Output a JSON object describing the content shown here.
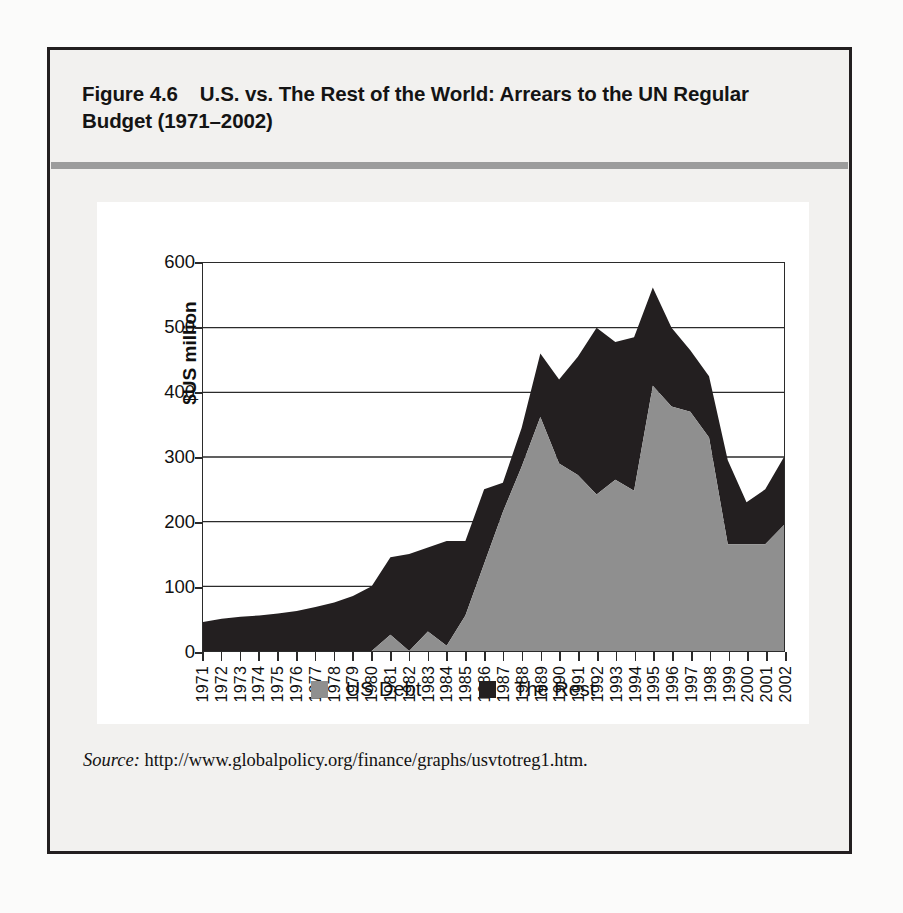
{
  "figure": {
    "number": "Figure 4.6",
    "title": "U.S. vs. The Rest of the World: Arrears to the UN Regular Budget (1971–2002)",
    "source_label": "Source:",
    "source_url": "http://www.globalpolicy.org/finance/graphs/usvtotreg1.htm."
  },
  "colors": {
    "us_debt": "#8f8f8f",
    "the_rest": "#231f20",
    "frame": "#231f20",
    "gridline": "#2b2b2b",
    "card_background": "#ffffff",
    "figure_background": "#f2f1ef",
    "title_rule": "#9c9c9c"
  },
  "chart_data": {
    "type": "area",
    "stacked": true,
    "title": "U.S. vs. The Rest of the World: Arrears to the UN Regular Budget (1971–2002)",
    "xlabel": "",
    "ylabel": "$US million",
    "ylim": [
      0,
      600
    ],
    "yticks": [
      0,
      100,
      200,
      300,
      400,
      500,
      600
    ],
    "ytick_labels": [
      "0",
      "100",
      "200",
      "300",
      "400",
      "500",
      "600"
    ],
    "grid": true,
    "grid_axis": "y",
    "legend_position": "bottom",
    "categories": [
      "1971",
      "1972",
      "1973",
      "1974",
      "1975",
      "1976",
      "1977",
      "1978",
      "1979",
      "1980",
      "1981",
      "1982",
      "1983",
      "1984",
      "1985",
      "1986",
      "1987",
      "1988",
      "1989",
      "1990",
      "1991",
      "1992",
      "1993",
      "1994",
      "1995",
      "1996",
      "1997",
      "1998",
      "1999",
      "2000",
      "2001",
      "2002"
    ],
    "series": [
      {
        "name": "US Debt",
        "color": "#8f8f8f",
        "values": [
          0,
          0,
          0,
          0,
          0,
          0,
          0,
          0,
          0,
          0,
          25,
          0,
          30,
          8,
          55,
          135,
          215,
          285,
          362,
          290,
          272,
          242,
          265,
          248,
          410,
          378,
          370,
          330,
          165,
          165,
          165,
          195
        ]
      },
      {
        "name": "The Rest",
        "color": "#231f20",
        "values": [
          45,
          50,
          53,
          55,
          58,
          62,
          68,
          75,
          85,
          100,
          120,
          150,
          130,
          162,
          115,
          115,
          45,
          60,
          98,
          130,
          183,
          258,
          213,
          237,
          152,
          122,
          95,
          95,
          130,
          65,
          85,
          105
        ]
      }
    ],
    "totals": [
      45,
      50,
      53,
      55,
      58,
      62,
      68,
      75,
      85,
      100,
      145,
      150,
      160,
      170,
      170,
      250,
      260,
      345,
      460,
      420,
      455,
      500,
      478,
      485,
      562,
      500,
      465,
      425,
      295,
      230,
      250,
      300
    ]
  },
  "legend": {
    "items": [
      {
        "label": "US Debt",
        "color": "#8f8f8f"
      },
      {
        "label": "The Rest",
        "color": "#231f20"
      }
    ]
  }
}
